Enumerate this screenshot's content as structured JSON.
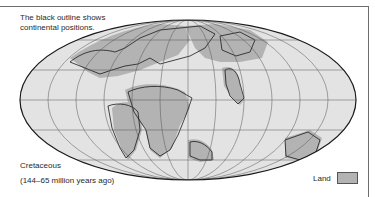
{
  "map": {
    "caption_line1": "The black outline shows",
    "caption_line2": "continental positions.",
    "period": "Cretaceous",
    "range": "(144–65 million years ago)",
    "legend": {
      "label": "Land",
      "swatch_color": "#b3b3b3"
    },
    "colors": {
      "ocean": "#e3e3e3",
      "land": "#b3b3b3",
      "outline": "#1a1a1a",
      "grid": "#555555"
    },
    "projection": "Mollweide-style elliptical world projection"
  }
}
